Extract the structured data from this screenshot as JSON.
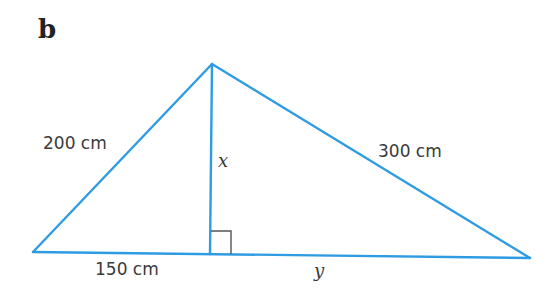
{
  "part_label": "b",
  "colors": {
    "line": "#2f9be2",
    "right_angle": "#555555",
    "text": "#3a3a3a"
  },
  "triangle": {
    "vertices": {
      "left": [
        33,
        252
      ],
      "apex": [
        212,
        64
      ],
      "right": [
        530,
        258
      ],
      "foot": [
        210,
        254
      ]
    },
    "right_angle_marker": {
      "at": "foot",
      "size": 21
    }
  },
  "labels": {
    "left_side": "200 cm",
    "right_side": "300 cm",
    "base_left": "150 cm",
    "base_right": "y",
    "height": "x"
  }
}
